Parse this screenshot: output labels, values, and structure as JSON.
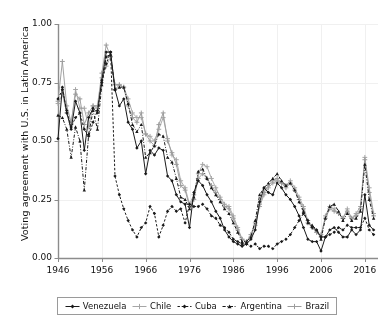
{
  "chart_data": {
    "type": "line",
    "title": "",
    "xlabel": "",
    "ylabel": "Voting agreement with U.S. in Latin America",
    "xlim": [
      1946,
      2019
    ],
    "ylim": [
      0.0,
      1.0
    ],
    "grid": true,
    "legend_position": "bottom",
    "xticks": [
      1946,
      1956,
      1966,
      1976,
      1986,
      1996,
      2006,
      2016
    ],
    "xtick_labels": [
      "1946",
      "1956",
      "1966",
      "1976",
      "1986",
      "1996",
      "2006",
      "2016"
    ],
    "yticks": [
      0.0,
      0.25,
      0.5,
      0.75,
      1.0
    ],
    "ytick_labels": [
      "0.00",
      "0.25",
      "0.50",
      "0.75",
      "1.00"
    ],
    "x": [
      1946,
      1947,
      1948,
      1949,
      1950,
      1951,
      1952,
      1953,
      1954,
      1955,
      1956,
      1957,
      1958,
      1959,
      1960,
      1961,
      1962,
      1963,
      1964,
      1965,
      1966,
      1967,
      1968,
      1969,
      1970,
      1971,
      1972,
      1973,
      1974,
      1975,
      1976,
      1977,
      1978,
      1979,
      1980,
      1981,
      1982,
      1983,
      1984,
      1985,
      1986,
      1987,
      1988,
      1989,
      1990,
      1991,
      1992,
      1993,
      1994,
      1995,
      1996,
      1997,
      1998,
      1999,
      2000,
      2001,
      2002,
      2003,
      2004,
      2005,
      2006,
      2007,
      2008,
      2009,
      2010,
      2011,
      2012,
      2013,
      2014,
      2015,
      2016,
      2017,
      2018
    ],
    "series": [
      {
        "name": "Venezuela",
        "color": "#1a1a1a",
        "marker": "diamond",
        "linestyle": "solid",
        "values": [
          0.51,
          0.73,
          0.62,
          0.55,
          0.67,
          0.62,
          0.46,
          0.6,
          0.64,
          0.62,
          0.76,
          0.88,
          0.88,
          0.72,
          0.65,
          0.68,
          0.58,
          0.55,
          0.47,
          0.5,
          0.36,
          0.46,
          0.44,
          0.47,
          0.46,
          0.35,
          0.33,
          0.27,
          0.24,
          0.23,
          0.13,
          0.28,
          0.33,
          0.31,
          0.27,
          0.24,
          0.2,
          0.17,
          0.12,
          0.09,
          0.07,
          0.06,
          0.05,
          0.06,
          0.08,
          0.12,
          0.24,
          0.3,
          0.28,
          0.27,
          0.32,
          0.3,
          0.27,
          0.25,
          0.22,
          0.18,
          0.13,
          0.08,
          0.07,
          0.07,
          0.03,
          0.09,
          0.12,
          0.13,
          0.11,
          0.09,
          0.09,
          0.12,
          0.1,
          0.12,
          0.27,
          0.14,
          0.12
        ]
      },
      {
        "name": "Chile",
        "color": "#a6a6a6",
        "marker": "plus",
        "linestyle": "solid",
        "values": [
          0.66,
          0.7,
          0.62,
          0.57,
          0.72,
          0.64,
          0.64,
          0.56,
          0.65,
          0.64,
          0.77,
          0.82,
          0.86,
          0.72,
          0.74,
          0.73,
          0.68,
          0.62,
          0.6,
          0.6,
          0.53,
          0.52,
          0.5,
          0.55,
          0.6,
          0.51,
          0.44,
          0.42,
          0.33,
          0.3,
          0.23,
          0.27,
          0.36,
          0.4,
          0.39,
          0.34,
          0.3,
          0.26,
          0.23,
          0.22,
          0.18,
          0.13,
          0.08,
          0.07,
          0.09,
          0.14,
          0.22,
          0.27,
          0.3,
          0.32,
          0.33,
          0.32,
          0.31,
          0.33,
          0.3,
          0.26,
          0.22,
          0.16,
          0.13,
          0.11,
          0.09,
          0.18,
          0.22,
          0.21,
          0.19,
          0.17,
          0.21,
          0.17,
          0.19,
          0.22,
          0.43,
          0.3,
          0.19
        ]
      },
      {
        "name": "Cuba",
        "color": "#1a1a1a",
        "marker": "diamond",
        "linestyle": "dashed",
        "values": [
          0.68,
          0.72,
          0.63,
          0.56,
          0.6,
          0.62,
          0.55,
          0.52,
          0.58,
          0.63,
          0.75,
          0.83,
          0.88,
          0.35,
          0.27,
          0.21,
          0.16,
          0.12,
          0.09,
          0.13,
          0.15,
          0.22,
          0.19,
          0.09,
          0.14,
          0.2,
          0.22,
          0.2,
          0.21,
          0.15,
          0.23,
          0.22,
          0.22,
          0.23,
          0.21,
          0.18,
          0.17,
          0.14,
          0.13,
          0.11,
          0.08,
          0.07,
          0.06,
          0.06,
          0.05,
          0.06,
          0.04,
          0.05,
          0.05,
          0.04,
          0.06,
          0.07,
          0.08,
          0.1,
          0.13,
          0.16,
          0.19,
          0.16,
          0.13,
          0.12,
          0.09,
          0.09,
          0.1,
          0.11,
          0.13,
          0.12,
          0.14,
          0.13,
          0.13,
          0.13,
          0.17,
          0.12,
          0.1
        ]
      },
      {
        "name": "Argentina",
        "color": "#1a1a1a",
        "marker": "triangle",
        "linestyle": "dashdot",
        "values": [
          0.61,
          0.6,
          0.55,
          0.43,
          0.56,
          0.5,
          0.29,
          0.53,
          0.63,
          0.55,
          0.74,
          0.86,
          0.87,
          0.72,
          0.73,
          0.73,
          0.66,
          0.57,
          0.54,
          0.57,
          0.43,
          0.45,
          0.48,
          0.53,
          0.52,
          0.43,
          0.41,
          0.34,
          0.26,
          0.25,
          0.21,
          0.26,
          0.37,
          0.38,
          0.34,
          0.3,
          0.27,
          0.24,
          0.21,
          0.19,
          0.15,
          0.11,
          0.07,
          0.07,
          0.09,
          0.16,
          0.27,
          0.3,
          0.32,
          0.34,
          0.36,
          0.33,
          0.31,
          0.32,
          0.29,
          0.24,
          0.2,
          0.15,
          0.14,
          0.12,
          0.08,
          0.17,
          0.22,
          0.23,
          0.2,
          0.16,
          0.19,
          0.16,
          0.17,
          0.2,
          0.4,
          0.25,
          0.17
        ]
      },
      {
        "name": "Brazil",
        "color": "#9c9c9c",
        "marker": "plus",
        "linestyle": "solid",
        "values": [
          0.67,
          0.84,
          0.65,
          0.58,
          0.7,
          0.68,
          0.57,
          0.62,
          0.65,
          0.65,
          0.79,
          0.91,
          0.86,
          0.74,
          0.74,
          0.73,
          0.65,
          0.6,
          0.58,
          0.62,
          0.53,
          0.5,
          0.48,
          0.57,
          0.62,
          0.5,
          0.45,
          0.4,
          0.31,
          0.29,
          0.22,
          0.25,
          0.34,
          0.36,
          0.34,
          0.31,
          0.28,
          0.25,
          0.22,
          0.21,
          0.17,
          0.12,
          0.08,
          0.07,
          0.1,
          0.15,
          0.23,
          0.28,
          0.31,
          0.33,
          0.34,
          0.32,
          0.3,
          0.32,
          0.29,
          0.25,
          0.21,
          0.15,
          0.13,
          0.11,
          0.1,
          0.17,
          0.21,
          0.2,
          0.19,
          0.17,
          0.2,
          0.17,
          0.18,
          0.21,
          0.42,
          0.28,
          0.18
        ]
      }
    ]
  },
  "axes": {
    "ylabel": "Voting agreement with U.S. in Latin America"
  },
  "legend": {
    "items": [
      {
        "label": "Venezuela"
      },
      {
        "label": "Chile"
      },
      {
        "label": "Cuba"
      },
      {
        "label": "Argentina"
      },
      {
        "label": "Brazil"
      }
    ]
  },
  "style": {
    "background": "#ffffff",
    "axis_color": "#8c8c8c",
    "grid_color": "#f0f0f0",
    "text_color": "#111111"
  }
}
